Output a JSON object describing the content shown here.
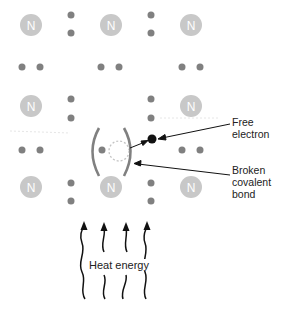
{
  "diagram": {
    "atom_symbol": "N",
    "atoms": [
      {
        "x": 31,
        "y": 25
      },
      {
        "x": 111,
        "y": 25
      },
      {
        "x": 191,
        "y": 25
      },
      {
        "x": 31,
        "y": 106
      },
      {
        "x": 111,
        "y": 106
      },
      {
        "x": 191,
        "y": 106
      },
      {
        "x": 31,
        "y": 187
      },
      {
        "x": 111,
        "y": 187
      },
      {
        "x": 191,
        "y": 187
      }
    ],
    "labels": {
      "free_electron": "Free\nelectron",
      "broken_bond": "Broken\ncovalent\nbond",
      "heat_energy": "Heat energy"
    },
    "colors": {
      "atom": "#c8c8c8",
      "electron": "#808080",
      "free_electron": "#111111",
      "bracket": "#808080",
      "hole": "#c0c0c0",
      "arrow": "#111111"
    }
  }
}
